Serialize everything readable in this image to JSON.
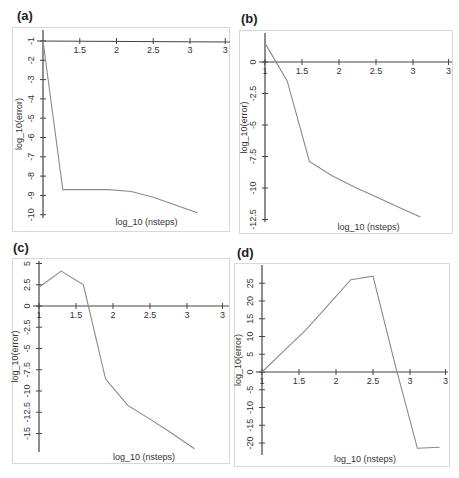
{
  "chart_data": [
    {
      "id": "a",
      "type": "line",
      "panel_label": "(a)",
      "xlabel": "log_10 (nsteps)",
      "ylabel": "log_10(error)",
      "xticks": [
        "1.5",
        "2",
        "2.5",
        "3",
        "3"
      ],
      "yticks": [
        "-1",
        "-2",
        "-3",
        "-4",
        "-5",
        "-6",
        "-7",
        "-8",
        "-9",
        "-10"
      ],
      "x": [
        1.0,
        1.27,
        1.9,
        2.2,
        2.5,
        2.8,
        3.1
      ],
      "y": [
        -1.0,
        -8.7,
        -8.7,
        -8.8,
        -9.1,
        -9.5,
        -9.9
      ],
      "grid": false
    },
    {
      "id": "b",
      "type": "line",
      "panel_label": "(b)",
      "xlabel": "log_10 (nsteps)",
      "ylabel": "log_10(error)",
      "xticks": [
        "1",
        "1.5",
        "2",
        "2.5",
        "3",
        "3"
      ],
      "yticks": [
        "0",
        "-2.5",
        "-5",
        "-7.5",
        "-10",
        "-12.5"
      ],
      "x": [
        1.0,
        1.3,
        1.6,
        1.9,
        2.2,
        2.5,
        2.8,
        3.1
      ],
      "y": [
        1.5,
        -1.5,
        -7.9,
        -9.0,
        -9.9,
        -10.7,
        -11.5,
        -12.3
      ],
      "grid": false
    },
    {
      "id": "c",
      "type": "line",
      "panel_label": "(c)",
      "xlabel": "log_10 (nsteps)",
      "ylabel": "log_10(error)",
      "xticks": [
        "1",
        "1.5",
        "2",
        "2.5",
        "3",
        "3"
      ],
      "yticks": [
        "5",
        "2.5",
        "0",
        "-2.5",
        "-5",
        "-7.5",
        "-10",
        "-12.5",
        "-15"
      ],
      "x": [
        1.0,
        1.3,
        1.6,
        1.9,
        2.2,
        2.5,
        2.8,
        3.1
      ],
      "y": [
        2.2,
        4.1,
        2.5,
        -8.6,
        -11.7,
        -13.3,
        -15.0,
        -16.8
      ],
      "grid": false
    },
    {
      "id": "d",
      "type": "line",
      "panel_label": "(d)",
      "xlabel": "log_10 (nsteps)",
      "ylabel": "log_10(error)",
      "xticks": [
        "1",
        "1.5",
        "2",
        "2.5",
        "3",
        "3"
      ],
      "yticks": [
        "25",
        "20",
        "15",
        "10",
        "5",
        "0",
        "-5",
        "-10",
        "-15",
        "-20"
      ],
      "x": [
        1.0,
        1.3,
        1.6,
        1.9,
        2.2,
        2.5,
        2.8,
        3.1,
        3.4
      ],
      "y": [
        0.0,
        6.0,
        12.0,
        19.0,
        26.0,
        27.0,
        2.0,
        -21.5,
        -21.2
      ],
      "grid": false
    }
  ]
}
